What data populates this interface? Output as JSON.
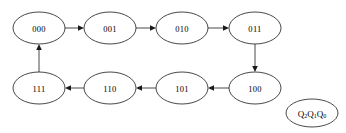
{
  "diagram": {
    "type": "state-transition-diagram",
    "title": "",
    "colors": {
      "background": "#ffffff",
      "stroke": "#1a1a1a",
      "text": "#000000"
    },
    "nodes": [
      {
        "id": "s000",
        "label": "000",
        "cx": 39,
        "cy": 28,
        "rx": 26,
        "ry": 16
      },
      {
        "id": "s001",
        "label": "001",
        "cx": 110,
        "cy": 28,
        "rx": 26,
        "ry": 16
      },
      {
        "id": "s010",
        "label": "010",
        "cx": 182,
        "cy": 28,
        "rx": 26,
        "ry": 16
      },
      {
        "id": "s011",
        "label": "011",
        "cx": 255,
        "cy": 28,
        "rx": 26,
        "ry": 16
      },
      {
        "id": "s100",
        "label": "100",
        "cx": 255,
        "cy": 88,
        "rx": 26,
        "ry": 16
      },
      {
        "id": "s101",
        "label": "101",
        "cx": 182,
        "cy": 88,
        "rx": 26,
        "ry": 16
      },
      {
        "id": "s110",
        "label": "110",
        "cx": 110,
        "cy": 88,
        "rx": 26,
        "ry": 16
      },
      {
        "id": "s111",
        "label": "111",
        "cx": 39,
        "cy": 88,
        "rx": 26,
        "ry": 16
      }
    ],
    "edges": [
      {
        "id": "e1",
        "from": "s000",
        "to": "s001",
        "label": ""
      },
      {
        "id": "e2",
        "from": "s001",
        "to": "s010",
        "label": ""
      },
      {
        "id": "e3",
        "from": "s010",
        "to": "s011",
        "label": ""
      },
      {
        "id": "e4",
        "from": "s011",
        "to": "s100",
        "label": ""
      },
      {
        "id": "e5",
        "from": "s100",
        "to": "s101",
        "label": ""
      },
      {
        "id": "e6",
        "from": "s101",
        "to": "s110",
        "label": ""
      },
      {
        "id": "e7",
        "from": "s110",
        "to": "s111",
        "label": ""
      },
      {
        "id": "e8",
        "from": "s111",
        "to": "s000",
        "label": ""
      }
    ],
    "legend": {
      "id": "legend-state-encoding",
      "cx": 312,
      "cy": 113,
      "rx": 26,
      "ry": 14,
      "text_main": "Q",
      "parts": [
        {
          "base": "Q",
          "sub": "2"
        },
        {
          "base": "Q",
          "sub": "1"
        },
        {
          "base": "Q",
          "sub": "0"
        }
      ],
      "label_plain": "Q2Q1Q0"
    }
  }
}
